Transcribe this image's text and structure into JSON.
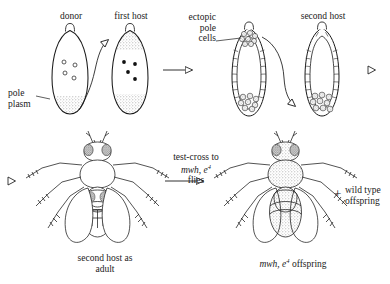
{
  "figure": {
    "background_color": "#ffffff",
    "line_color": "#1a1a1a",
    "stipple_color": "#b9b9b9",
    "eye_color": "#7a7a7a"
  },
  "labels": {
    "donor": "donor",
    "first_host": "first host",
    "pole_plasm": "pole\nplasm",
    "ectopic_pole_cells": "ectopic\npole\ncells",
    "second_host": "second host",
    "second_host_as_adult": "second host as\nadult",
    "test_cross_line1": "test-cross to",
    "test_cross_line2_italic": "mwh, e",
    "test_cross_line2_sup": "4",
    "test_cross_line3": "flies",
    "offspring_italic": "mwh, e",
    "offspring_sup": "4",
    "offspring_rest": " offspring",
    "plus_sign": "+",
    "wild_type_offspring": "wild type\noffspring"
  },
  "panels": [
    {
      "id": "donor-embryo",
      "label": "donor",
      "stage": "syncytial blastoderm",
      "nuclei_count": 4,
      "nuclei_style": "open-circle",
      "pole_plasm_regions": [
        "posterior"
      ]
    },
    {
      "id": "first-host-embryo",
      "label": "first host",
      "stage": "syncytial blastoderm",
      "nuclei_count": 4,
      "nuclei_style": "filled-dot",
      "pole_plasm_regions": [
        "anterior",
        "posterior"
      ]
    },
    {
      "id": "first-host-blastoderm",
      "label": "ectopic pole cells",
      "stage": "cellular blastoderm",
      "pole_cell_clusters": [
        "anterior",
        "posterior"
      ]
    },
    {
      "id": "second-host-blastoderm",
      "label": "second host",
      "stage": "cellular blastoderm",
      "pole_cell_clusters": [
        "posterior"
      ]
    },
    {
      "id": "second-host-adult",
      "label": "second host as adult",
      "body_shading": "unshaded",
      "phenotype": "wild type body"
    },
    {
      "id": "offspring-adult",
      "label": "mwh, e4 offspring",
      "body_shading": "stippled",
      "phenotype": "mwh, e4 mutant"
    }
  ],
  "arrows": [
    {
      "id": "donor-to-first-host",
      "style": "curved-open-head"
    },
    {
      "id": "panel1-to-panel2",
      "style": "straight-open-head"
    },
    {
      "id": "blastoderm-transplant",
      "style": "curved-open-head"
    },
    {
      "id": "second-host-to-adult",
      "style": "open-head-only"
    },
    {
      "id": "second-host-blastoderm-to-adult",
      "style": "open-head-only"
    },
    {
      "id": "test-cross-arrow",
      "style": "straight-open-head"
    }
  ]
}
